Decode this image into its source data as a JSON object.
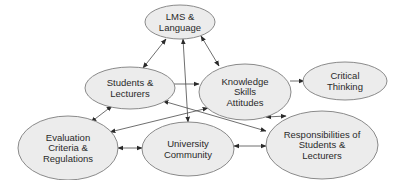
{
  "diagram": {
    "title": "",
    "colors": {
      "node_fill": "#ececec",
      "node_stroke": "#8a8a8a",
      "edge": "#4a4a4a",
      "text": "#2a2a2a",
      "background": "#ffffff"
    },
    "nodes": [
      {
        "id": "lms",
        "lines": [
          "LMS &",
          "Language"
        ],
        "cx": 180,
        "cy": 22,
        "rx": 35,
        "ry": 17
      },
      {
        "id": "students",
        "lines": [
          "Students &",
          "Lecturers"
        ],
        "cx": 130,
        "cy": 88,
        "rx": 45,
        "ry": 21
      },
      {
        "id": "knowledge",
        "lines": [
          "Knowledge",
          "Skills",
          "Attitudes"
        ],
        "cx": 245,
        "cy": 92,
        "rx": 46,
        "ry": 28
      },
      {
        "id": "critical",
        "lines": [
          "Critical",
          "Thinking"
        ],
        "cx": 345,
        "cy": 81,
        "rx": 42,
        "ry": 19
      },
      {
        "id": "evaluation",
        "lines": [
          "Evaluation",
          "Criteria &",
          "Regulations"
        ],
        "cx": 68,
        "cy": 148,
        "rx": 50,
        "ry": 32
      },
      {
        "id": "university",
        "lines": [
          "University",
          "Community"
        ],
        "cx": 188,
        "cy": 149,
        "rx": 46,
        "ry": 27
      },
      {
        "id": "responsibilities",
        "lines": [
          "Responsibilities of",
          "Students &",
          "Lecturers"
        ],
        "cx": 322,
        "cy": 145,
        "rx": 56,
        "ry": 34
      }
    ],
    "edges": [
      {
        "from": "lms",
        "to": "students",
        "x1": 166,
        "y1": 39,
        "x2": 143,
        "y2": 68,
        "start_arrow": true,
        "end_arrow": true
      },
      {
        "from": "lms",
        "to": "knowledge",
        "x1": 201,
        "y1": 36,
        "x2": 219,
        "y2": 66,
        "start_arrow": true,
        "end_arrow": true
      },
      {
        "from": "lms",
        "to": "university",
        "x1": 183,
        "y1": 39,
        "x2": 188,
        "y2": 122,
        "start_arrow": true,
        "end_arrow": true
      },
      {
        "from": "students",
        "to": "knowledge",
        "x1": 168,
        "y1": 84,
        "x2": 199,
        "y2": 84,
        "start_arrow": true,
        "end_arrow": true
      },
      {
        "from": "knowledge",
        "to": "critical",
        "x1": 290,
        "y1": 81,
        "x2": 304,
        "y2": 81,
        "start_arrow": false,
        "end_arrow": true
      },
      {
        "from": "students",
        "to": "evaluation",
        "x1": 112,
        "y1": 106,
        "x2": 91,
        "y2": 122,
        "start_arrow": true,
        "end_arrow": true
      },
      {
        "from": "knowledge",
        "to": "evaluation",
        "x1": 208,
        "y1": 108,
        "x2": 110,
        "y2": 132,
        "start_arrow": true,
        "end_arrow": true
      },
      {
        "from": "students",
        "to": "responsibilities",
        "x1": 163,
        "y1": 101,
        "x2": 266,
        "y2": 131,
        "start_arrow": true,
        "end_arrow": true
      },
      {
        "from": "knowledge",
        "to": "responsibilities",
        "x1": 266,
        "y1": 117,
        "x2": 286,
        "y2": 116,
        "start_arrow": true,
        "end_arrow": true
      },
      {
        "from": "evaluation",
        "to": "university",
        "x1": 118,
        "y1": 148,
        "x2": 142,
        "y2": 148,
        "start_arrow": true,
        "end_arrow": true
      },
      {
        "from": "university",
        "to": "responsibilities",
        "x1": 234,
        "y1": 146,
        "x2": 266,
        "y2": 146,
        "start_arrow": true,
        "end_arrow": true
      }
    ]
  }
}
